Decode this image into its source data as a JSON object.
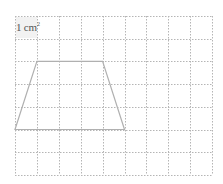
{
  "unit_label": {
    "text": "1 cm",
    "superscript": "2"
  },
  "grid": {
    "columns": 9,
    "rows": 7,
    "origin_x": 15,
    "origin_y": 16,
    "cell_width": 21.9,
    "cell_height": 22.7,
    "line_color": "#b5b5b5",
    "line_style": "dotted"
  },
  "shape": {
    "type": "trapezoid",
    "stroke_color": "#b0b0b0",
    "vertices_grid": [
      [
        1,
        2
      ],
      [
        4,
        2
      ],
      [
        5,
        5
      ],
      [
        0,
        5
      ]
    ]
  }
}
